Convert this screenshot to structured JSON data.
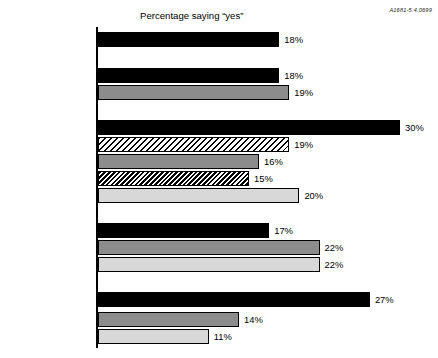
{
  "doc_code": "A1681-5.4.0699",
  "chart_data": {
    "type": "bar",
    "orientation": "horizontal",
    "title": "Percentage saying “yes”",
    "xlabel": "",
    "ylabel": "",
    "xlim": [
      0,
      30
    ],
    "grid": false,
    "legend": "none",
    "value_suffix": "%",
    "axis_line": "left",
    "groups": [
      {
        "name": "overall",
        "categories": [
          "Total"
        ],
        "values": [
          18
        ],
        "value_labels": [
          "18%"
        ],
        "fills": [
          "black"
        ]
      },
      {
        "name": "gender",
        "categories": [
          "Male",
          "Female"
        ],
        "values": [
          18,
          19
        ],
        "value_labels": [
          "18%",
          "19%"
        ],
        "fills": [
          "black",
          "midgray"
        ]
      },
      {
        "name": "age",
        "categories": [
          "16–20",
          "21–29",
          "30–44",
          "45–59",
          "60+"
        ],
        "values": [
          30,
          19,
          16,
          15,
          20
        ],
        "value_labels": [
          "30%",
          "19%",
          "16%",
          "15%",
          "20%"
        ],
        "fills": [
          "black",
          "hatch-light",
          "midgray",
          "hatch-dense",
          "lightgray"
        ]
      },
      {
        "name": "race",
        "categories": [
          "White",
          "African-American",
          "Hispanic"
        ],
        "values": [
          17,
          22,
          22
        ],
        "value_labels": [
          "17%",
          "22%",
          "22%"
        ],
        "fills": [
          "black",
          "midgray",
          "lightgray"
        ]
      },
      {
        "name": "education",
        "categories": [
          "High school grad\nor less",
          "Some college",
          "College+"
        ],
        "values": [
          27,
          14,
          11
        ],
        "value_labels": [
          "27%",
          "14%",
          "11%"
        ],
        "fills": [
          "black",
          "midgray",
          "lightgray"
        ]
      }
    ],
    "categories": [
      "Total",
      "Male",
      "Female",
      "16–20",
      "21–29",
      "30–44",
      "45–59",
      "60+",
      "White",
      "African-American",
      "Hispanic",
      "High school grad or less",
      "Some college",
      "College+"
    ],
    "values": [
      18,
      18,
      19,
      30,
      19,
      16,
      15,
      20,
      17,
      22,
      22,
      27,
      14,
      11
    ]
  },
  "rows": [
    {
      "label": "Total",
      "value_label": "18%",
      "value": 18,
      "fill": "fill-black",
      "top": 32,
      "two_line": false
    },
    {
      "label": "Male",
      "value_label": "18%",
      "value": 18,
      "fill": "fill-black",
      "top": 68,
      "two_line": false
    },
    {
      "label": "Female",
      "value_label": "19%",
      "value": 19,
      "fill": "fill-midgray",
      "top": 85,
      "two_line": false
    },
    {
      "label": "16–20",
      "value_label": "30%",
      "value": 30,
      "fill": "fill-black",
      "top": 120,
      "two_line": false
    },
    {
      "label": "21–29",
      "value_label": "19%",
      "value": 19,
      "fill": "fill-hatch-light",
      "top": 137,
      "two_line": false
    },
    {
      "label": "30–44",
      "value_label": "16%",
      "value": 16,
      "fill": "fill-midgray",
      "top": 154,
      "two_line": false
    },
    {
      "label": "45–59",
      "value_label": "15%",
      "value": 15,
      "fill": "fill-hatch-dense",
      "top": 171,
      "two_line": false
    },
    {
      "label": "60+",
      "value_label": "20%",
      "value": 20,
      "fill": "fill-lightgray",
      "top": 188,
      "two_line": false
    },
    {
      "label": "White",
      "value_label": "17%",
      "value": 17,
      "fill": "fill-black",
      "top": 223,
      "two_line": false
    },
    {
      "label": "African-American",
      "value_label": "22%",
      "value": 22,
      "fill": "fill-midgray",
      "top": 240,
      "two_line": false
    },
    {
      "label": "Hispanic",
      "value_label": "22%",
      "value": 22,
      "fill": "fill-lightgray",
      "top": 257,
      "two_line": false
    },
    {
      "label": "High school grad\nor less",
      "value_label": "27%",
      "value": 27,
      "fill": "fill-black",
      "top": 292,
      "two_line": true
    },
    {
      "label": "Some college",
      "value_label": "14%",
      "value": 14,
      "fill": "fill-midgray",
      "top": 312,
      "two_line": false
    },
    {
      "label": "College+",
      "value_label": "11%",
      "value": 11,
      "fill": "fill-lightgray",
      "top": 329,
      "two_line": false
    }
  ],
  "scale": {
    "origin_x": 98,
    "px_per_percent": 10.07,
    "value_gap": 5
  }
}
